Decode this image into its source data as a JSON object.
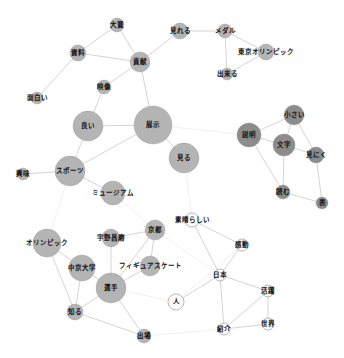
{
  "graph": {
    "type": "co-occurrence-network",
    "colors": {
      "node_gray": "#b4b4b4",
      "node_dark": "#8c8c8c",
      "node_white": "#ffffff",
      "node_stroke": "#9a9a9a",
      "edge": "#cfcfcf",
      "edge_faint": "#ececec"
    },
    "nodes": [
      {
        "id": "taisho",
        "label": "大賞",
        "x": 117,
        "y": 25,
        "r": 7,
        "fill": "gray"
      },
      {
        "id": "shiryo",
        "label": "資料",
        "x": 78,
        "y": 53,
        "r": 8,
        "fill": "gray"
      },
      {
        "id": "koken",
        "label": "貢献",
        "x": 140,
        "y": 62,
        "r": 10,
        "fill": "gray"
      },
      {
        "id": "eizo",
        "label": "映像",
        "x": 104,
        "y": 87,
        "r": 7,
        "fill": "gray"
      },
      {
        "id": "omoshiroi",
        "label": "面白い",
        "x": 37,
        "y": 98,
        "r": 6,
        "fill": "gray"
      },
      {
        "id": "mireru",
        "label": "見れる",
        "x": 180,
        "y": 31,
        "r": 8,
        "fill": "gray"
      },
      {
        "id": "medal",
        "label": "メダル",
        "x": 225,
        "y": 31,
        "r": 7,
        "fill": "gray"
      },
      {
        "id": "tokyo",
        "label": "東京オリンピック",
        "x": 266,
        "y": 52,
        "r": 8,
        "fill": "gray"
      },
      {
        "id": "dekiru",
        "label": "出来る",
        "x": 227,
        "y": 74,
        "r": 6,
        "fill": "gray"
      },
      {
        "id": "yoi",
        "label": "良い",
        "x": 88,
        "y": 126,
        "r": 15,
        "fill": "gray"
      },
      {
        "id": "tenji",
        "label": "展示",
        "x": 153,
        "y": 125,
        "r": 19,
        "fill": "gray"
      },
      {
        "id": "miru",
        "label": "見る",
        "x": 184,
        "y": 158,
        "r": 15,
        "fill": "gray"
      },
      {
        "id": "sports",
        "label": "スポーツ",
        "x": 70,
        "y": 171,
        "r": 15,
        "fill": "gray"
      },
      {
        "id": "kyomi",
        "label": "興味",
        "x": 23,
        "y": 174,
        "r": 6,
        "fill": "gray"
      },
      {
        "id": "museum",
        "label": "ミュージアム",
        "x": 113,
        "y": 193,
        "r": 12,
        "fill": "gray"
      },
      {
        "id": "setsumei",
        "label": "説明",
        "x": 249,
        "y": 135,
        "r": 12,
        "fill": "dark"
      },
      {
        "id": "chiisai",
        "label": "小さい",
        "x": 294,
        "y": 115,
        "r": 10,
        "fill": "dark"
      },
      {
        "id": "moji",
        "label": "文字",
        "x": 284,
        "y": 145,
        "r": 11,
        "fill": "dark"
      },
      {
        "id": "minikui",
        "label": "見にく",
        "x": 316,
        "y": 155,
        "r": 8,
        "fill": "dark"
      },
      {
        "id": "yomu",
        "label": "読む",
        "x": 283,
        "y": 192,
        "r": 7,
        "fill": "dark"
      },
      {
        "id": "hyo",
        "label": "表",
        "x": 322,
        "y": 203,
        "r": 6,
        "fill": "dark"
      },
      {
        "id": "subarashii",
        "label": "素晴らしい",
        "x": 192,
        "y": 220,
        "r": 7,
        "fill": "white"
      },
      {
        "id": "kando",
        "label": "感動",
        "x": 242,
        "y": 245,
        "r": 6,
        "fill": "white"
      },
      {
        "id": "nihon",
        "label": "日本",
        "x": 220,
        "y": 275,
        "r": 6,
        "fill": "white"
      },
      {
        "id": "hito",
        "label": "人",
        "x": 176,
        "y": 302,
        "r": 8,
        "fill": "white"
      },
      {
        "id": "katsuyaku",
        "label": "活躍",
        "x": 268,
        "y": 291,
        "r": 6,
        "fill": "white"
      },
      {
        "id": "sekai",
        "label": "世界",
        "x": 268,
        "y": 324,
        "r": 6,
        "fill": "white"
      },
      {
        "id": "shokai",
        "label": "紹介",
        "x": 224,
        "y": 329,
        "r": 6,
        "fill": "white"
      },
      {
        "id": "olympic",
        "label": "オリンピック",
        "x": 47,
        "y": 243,
        "r": 14,
        "fill": "gray"
      },
      {
        "id": "chukyo",
        "label": "中京大学",
        "x": 82,
        "y": 268,
        "r": 13,
        "fill": "gray"
      },
      {
        "id": "uno",
        "label": "宇野昌磨",
        "x": 111,
        "y": 238,
        "r": 9,
        "fill": "gray"
      },
      {
        "id": "kyoto",
        "label": "京都",
        "x": 155,
        "y": 230,
        "r": 10,
        "fill": "gray"
      },
      {
        "id": "figure",
        "label": "フィギュアスケート",
        "x": 150,
        "y": 266,
        "r": 10,
        "fill": "gray"
      },
      {
        "id": "senshu",
        "label": "選手",
        "x": 111,
        "y": 288,
        "r": 15,
        "fill": "gray"
      },
      {
        "id": "shiru",
        "label": "知る",
        "x": 75,
        "y": 312,
        "r": 8,
        "fill": "gray"
      },
      {
        "id": "shutsujo",
        "label": "出場",
        "x": 144,
        "y": 336,
        "r": 7,
        "fill": "gray"
      }
    ],
    "edges": [
      [
        "taisho",
        "shiryo",
        "n"
      ],
      [
        "taisho",
        "koken",
        "n"
      ],
      [
        "shiryo",
        "koken",
        "n"
      ],
      [
        "shiryo",
        "omoshiroi",
        "n"
      ],
      [
        "koken",
        "eizo",
        "n"
      ],
      [
        "koken",
        "tenji",
        "n"
      ],
      [
        "koken",
        "mireru",
        "n"
      ],
      [
        "eizo",
        "yoi",
        "n"
      ],
      [
        "mireru",
        "medal",
        "n"
      ],
      [
        "medal",
        "tokyo",
        "n"
      ],
      [
        "medal",
        "dekiru",
        "n"
      ],
      [
        "dekiru",
        "tokyo",
        "n"
      ],
      [
        "yoi",
        "tenji",
        "n"
      ],
      [
        "yoi",
        "sports",
        "n"
      ],
      [
        "tenji",
        "miru",
        "n"
      ],
      [
        "tenji",
        "sports",
        "n"
      ],
      [
        "sports",
        "kyomi",
        "n"
      ],
      [
        "sports",
        "museum",
        "n"
      ],
      [
        "sports",
        "olympic",
        "f"
      ],
      [
        "tenji",
        "setsumei",
        "f"
      ],
      [
        "miru",
        "subarashii",
        "f"
      ],
      [
        "museum",
        "kyoto",
        "f"
      ],
      [
        "setsumei",
        "chiisai",
        "n"
      ],
      [
        "setsumei",
        "moji",
        "n"
      ],
      [
        "setsumei",
        "yomu",
        "n"
      ],
      [
        "chiisai",
        "moji",
        "n"
      ],
      [
        "chiisai",
        "minikui",
        "n"
      ],
      [
        "moji",
        "minikui",
        "n"
      ],
      [
        "moji",
        "yomu",
        "n"
      ],
      [
        "minikui",
        "hyo",
        "n"
      ],
      [
        "yomu",
        "hyo",
        "n"
      ],
      [
        "subarashii",
        "kando",
        "n"
      ],
      [
        "subarashii",
        "nihon",
        "n"
      ],
      [
        "kando",
        "nihon",
        "n"
      ],
      [
        "nihon",
        "hito",
        "n"
      ],
      [
        "nihon",
        "katsuyaku",
        "n"
      ],
      [
        "nihon",
        "shokai",
        "n"
      ],
      [
        "katsuyaku",
        "sekai",
        "n"
      ],
      [
        "katsuyaku",
        "shokai",
        "n"
      ],
      [
        "sekai",
        "shokai",
        "n"
      ],
      [
        "kando",
        "hito",
        "f"
      ],
      [
        "senshu",
        "hito",
        "f"
      ],
      [
        "shutsujo",
        "shokai",
        "f"
      ],
      [
        "olympic",
        "chukyo",
        "n"
      ],
      [
        "olympic",
        "shiru",
        "n"
      ],
      [
        "chukyo",
        "shiru",
        "n"
      ],
      [
        "chukyo",
        "senshu",
        "n"
      ],
      [
        "uno",
        "kyoto",
        "n"
      ],
      [
        "uno",
        "senshu",
        "n"
      ],
      [
        "kyoto",
        "figure",
        "n"
      ],
      [
        "kyoto",
        "senshu",
        "n"
      ],
      [
        "figure",
        "senshu",
        "n"
      ],
      [
        "senshu",
        "shiru",
        "n"
      ],
      [
        "senshu",
        "shutsujo",
        "n"
      ],
      [
        "shiru",
        "shutsujo",
        "n"
      ],
      [
        "kyoto",
        "nihon",
        "f"
      ]
    ]
  }
}
